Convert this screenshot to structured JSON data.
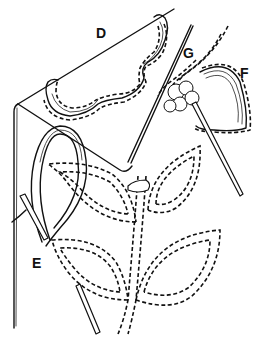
{
  "figure": {
    "labels": {
      "d": "D",
      "e": "E",
      "f": "F",
      "g": "G"
    },
    "colors": {
      "ink": "#111111",
      "background": "#ffffff"
    }
  }
}
